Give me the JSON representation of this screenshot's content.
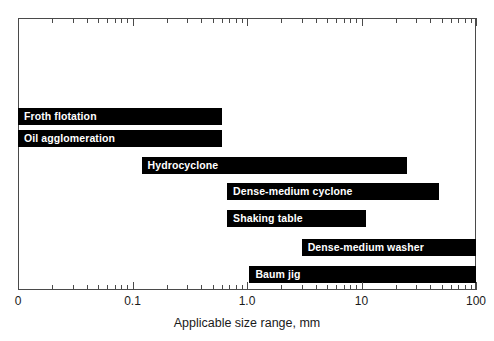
{
  "chart_data": {
    "type": "bar",
    "orientation": "horizontal-range",
    "title": "",
    "xlabel": "Applicable size range, mm",
    "ylabel": "",
    "xscale": "log",
    "xlim": [
      0.01,
      100
    ],
    "grid": false,
    "legend": null,
    "axis_ticks": {
      "major_labels": [
        "0",
        "0.1",
        "1.0",
        "10",
        "100"
      ],
      "major_values": [
        0.01,
        0.1,
        1.0,
        10,
        100
      ]
    },
    "categories": [
      "Froth flotation",
      "Oil agglomeration",
      "Hydrocyclone",
      "Dense-medium cyclone",
      "Shaking table",
      "Dense-medium washer",
      "Baum jig"
    ],
    "ranges": [
      {
        "label": "Froth flotation",
        "start": 0.01,
        "end": 0.6
      },
      {
        "label": "Oil agglomeration",
        "start": 0.01,
        "end": 0.6
      },
      {
        "label": "Hydrocyclone",
        "start": 0.12,
        "end": 25
      },
      {
        "label": "Dense-medium cyclone",
        "start": 0.67,
        "end": 48
      },
      {
        "label": "Shaking table",
        "start": 0.67,
        "end": 11
      },
      {
        "label": "Dense-medium washer",
        "start": 3.0,
        "end": 100
      },
      {
        "label": "Baum jig",
        "start": 1.05,
        "end": 100
      }
    ],
    "colors": {
      "bar": "#000000",
      "bar_label": "#ffffff",
      "frame": "#4a4a4a",
      "axis_text": "#1a1a1a",
      "background": "#ffffff"
    }
  }
}
